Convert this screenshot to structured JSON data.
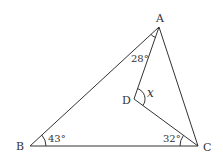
{
  "diagram": {
    "type": "geometry-triangle",
    "points": {
      "A": {
        "label": "A",
        "x": 159,
        "y": 27
      },
      "B": {
        "label": "B",
        "x": 30,
        "y": 146
      },
      "C": {
        "label": "C",
        "x": 198,
        "y": 146
      },
      "D": {
        "label": "D",
        "x": 134,
        "y": 99
      }
    },
    "segments": [
      "AB",
      "BC",
      "CA",
      "AD",
      "DC"
    ],
    "angles": {
      "BAD": {
        "label": "28°"
      },
      "ABC": {
        "label": "43°"
      },
      "DCB": {
        "label": "32°"
      },
      "ADC": {
        "label": "x"
      }
    },
    "colors": {
      "stroke": "#333333",
      "background": "#ffffff"
    }
  }
}
